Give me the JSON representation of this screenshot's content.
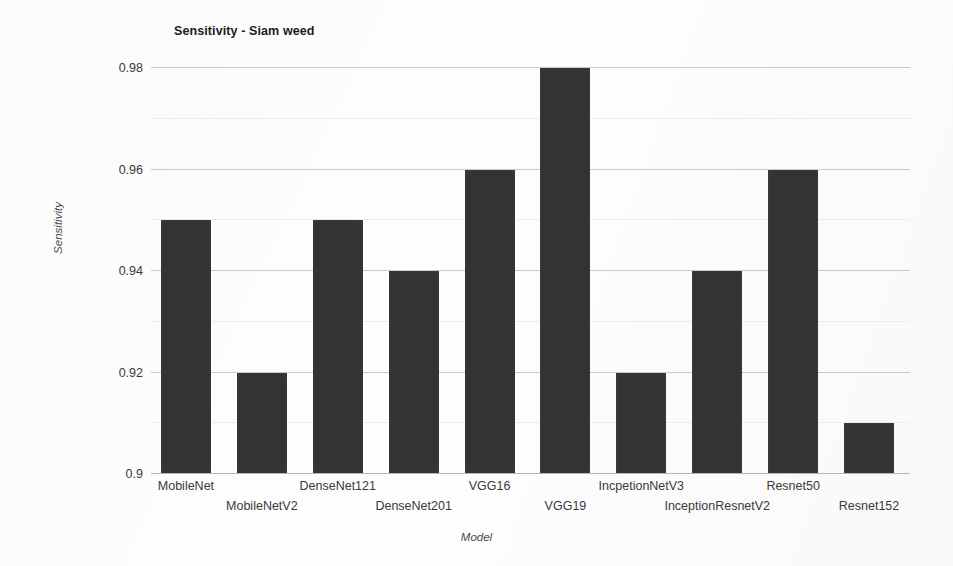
{
  "chart_data": {
    "type": "bar",
    "title": "Sensitivity - Siam weed",
    "xlabel": "Model",
    "ylabel": "Sensitivity",
    "categories": [
      "MobileNet",
      "MobileNetV2",
      "DenseNet121",
      "DenseNet201",
      "VGG16",
      "VGG19",
      "IncpetionNetV3",
      "InceptionResnetV2",
      "Resnet50",
      "Resnet152"
    ],
    "values": [
      0.95,
      0.92,
      0.95,
      0.94,
      0.96,
      0.98,
      0.92,
      0.94,
      0.96,
      0.91
    ],
    "ylim": [
      0.9,
      0.98
    ],
    "ytick_labels": [
      "0.9",
      "0.92",
      "0.94",
      "0.96",
      "0.98"
    ],
    "ytick_values": [
      0.9,
      0.92,
      0.94,
      0.96,
      0.98
    ],
    "minor_tick_values": [
      0.91,
      0.93,
      0.95,
      0.97
    ],
    "grid": true,
    "legend": "none",
    "bar_color": "#333333",
    "gridline_color": "#c9c9c9",
    "minor_gridline_color": "#ececec"
  }
}
